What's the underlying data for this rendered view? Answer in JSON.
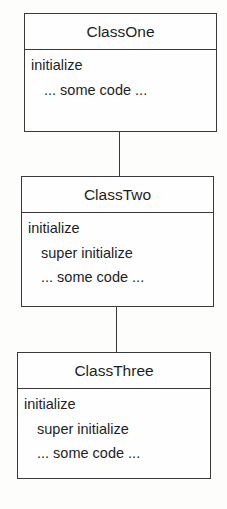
{
  "classes": [
    {
      "name": "ClassOne",
      "lines": [
        "initialize",
        "... some code ..."
      ]
    },
    {
      "name": "ClassTwo",
      "lines": [
        "initialize",
        "super initialize",
        "... some code ..."
      ]
    },
    {
      "name": "ClassThree",
      "lines": [
        "initialize",
        "super initialize",
        "... some code ..."
      ]
    }
  ]
}
